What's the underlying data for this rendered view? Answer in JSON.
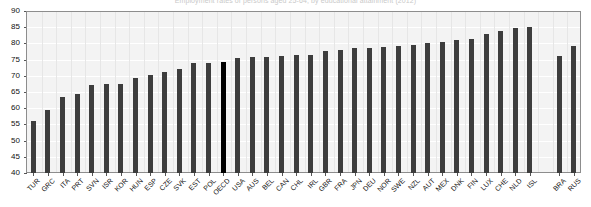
{
  "chart_data": {
    "type": "bar",
    "title": "Employment rates of persons aged 25-64, by educational attainment (2012)",
    "xlabel": "",
    "ylabel": "",
    "ylim": [
      40,
      90
    ],
    "ytick_step": 5,
    "yticks": [
      90,
      85,
      80,
      75,
      70,
      65,
      60,
      55,
      50,
      45,
      40
    ],
    "grid": true,
    "legend": "none",
    "highlight_category": "OECD",
    "highlight_color": "#000000",
    "bar_color": "#3d3d3d",
    "gap_after": "ISL",
    "categories": [
      "TUR",
      "GRC",
      "ITA",
      "PRT",
      "SVN",
      "ISR",
      "KOR",
      "HUN",
      "ESP",
      "CZE",
      "SVK",
      "EST",
      "POL",
      "OECD",
      "USA",
      "AUS",
      "BEL",
      "CAN",
      "CHL",
      "IRL",
      "GBR",
      "FRA",
      "JPN",
      "DEU",
      "NOR",
      "SWE",
      "NZL",
      "AUT",
      "MEX",
      "DNK",
      "FIN",
      "LUX",
      "CHE",
      "NLD",
      "ISL",
      "BRA",
      "RUS"
    ],
    "values": [
      56.0,
      59.5,
      63.5,
      64.5,
      67.3,
      67.5,
      67.5,
      69.4,
      70.3,
      71.1,
      72.2,
      74.0,
      74.0,
      74.2,
      75.5,
      75.7,
      75.8,
      76.0,
      76.3,
      76.5,
      77.6,
      78.0,
      78.5,
      78.7,
      79.0,
      79.2,
      79.5,
      80.1,
      80.3,
      81.0,
      81.5,
      82.8,
      83.8,
      84.8,
      85.0,
      76.0,
      79.2
    ]
  }
}
